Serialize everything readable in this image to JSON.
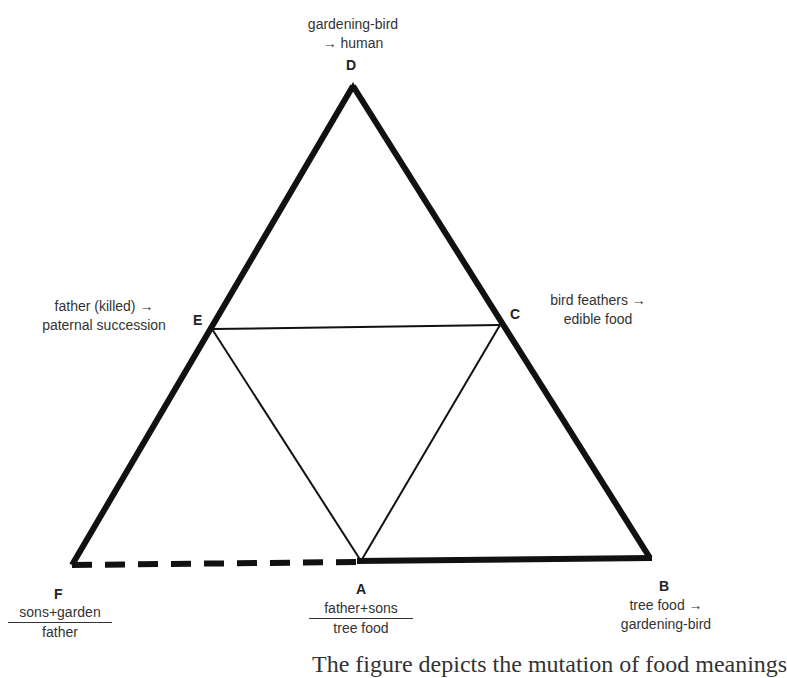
{
  "vertices": {
    "D": {
      "letter": "D",
      "line1": "gardening-bird",
      "line2": "→ human"
    },
    "E": {
      "letter": "E",
      "line1": "father (killed) →",
      "line2": "paternal succession"
    },
    "C": {
      "letter": "C",
      "line1": "bird feathers →",
      "line2": "edible food"
    },
    "F": {
      "letter": "F",
      "numerator": "sons+garden",
      "denominator": "father"
    },
    "A": {
      "letter": "A",
      "numerator": "father+sons",
      "denominator": "tree food"
    },
    "B": {
      "letter": "B",
      "line1": "tree food →",
      "line2": "gardening-bird"
    }
  },
  "caption_fragment": "The figure depicts the mutation of food meanings",
  "edges": {
    "outer": [
      "D-F",
      "D-B",
      "A-B"
    ],
    "dashed": [
      "F-A"
    ],
    "inner": [
      "E-C",
      "E-A",
      "C-A"
    ]
  },
  "colors": {
    "line": "#111111",
    "text": "#333333"
  }
}
